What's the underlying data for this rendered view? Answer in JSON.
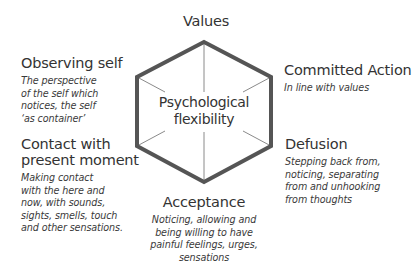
{
  "diagram": {
    "center": {
      "lines": [
        "Psychological",
        "flexibility"
      ]
    },
    "nodes": {
      "values": {
        "title": "Values"
      },
      "committed_action": {
        "title": "Committed Action",
        "description": [
          "In line with values"
        ]
      },
      "defusion": {
        "title": "Defusion",
        "description": [
          "Stepping back from,",
          "noticing, separating",
          "from and unhooking",
          "from thoughts"
        ]
      },
      "acceptance": {
        "title": "Acceptance",
        "description": [
          "Noticing, allowing and",
          "being willing to have",
          "painful feelings, urges,",
          "sensations"
        ]
      },
      "contact_present_moment": {
        "title": [
          "Contact with",
          "present moment"
        ],
        "description": [
          "Making contact",
          "with the here and",
          "now, with sounds,",
          "sights, smells, touch",
          "and other sensations."
        ]
      },
      "observing_self": {
        "title": "Observing self",
        "description": [
          "The perspective",
          "of the self which",
          "notices, the self",
          "‘as container’"
        ]
      }
    },
    "colors": {
      "hexagon_stroke": "#555555",
      "spoke_stroke": "#8a8a8a",
      "text": "#333333"
    }
  }
}
